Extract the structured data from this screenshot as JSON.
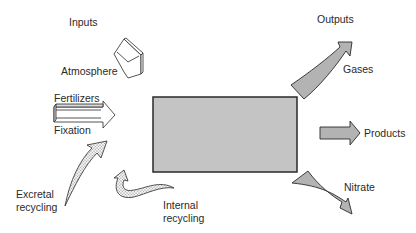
{
  "diagram": {
    "type": "nutrient-flow-box-model",
    "central_box": {
      "label": "",
      "fill": "#c4c4c4",
      "stroke": "#2a2a2a"
    },
    "inputs": {
      "heading": "Inputs",
      "items": [
        {
          "label": "Atmosphere",
          "arrow_style": "outline-3d"
        },
        {
          "label": "Fertilizers",
          "arrow_style": "outline-3d"
        },
        {
          "label": "Fixation",
          "arrow_style": "outline-3d"
        },
        {
          "label_line1": "Excretal",
          "label_line2": "recycling",
          "arrow_style": "stippled-curved"
        },
        {
          "label_line1": "Internal",
          "label_line2": "recycling",
          "arrow_style": "stippled-curved"
        }
      ]
    },
    "outputs": {
      "heading": "Outputs",
      "items": [
        {
          "label": "Gases",
          "arrow_style": "grey-curved"
        },
        {
          "label": "Products",
          "arrow_style": "grey-straight"
        },
        {
          "label": "Nitrate",
          "arrow_style": "grey-curved"
        }
      ]
    },
    "colors": {
      "grey_arrow_fill": "#b3b3b3",
      "stipple_fill": "#dcdcdc",
      "outline": "#2a2a2a",
      "background": "#ffffff"
    }
  }
}
